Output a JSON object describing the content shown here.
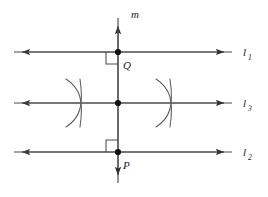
{
  "figure": {
    "type": "geometry-diagram",
    "width": 268,
    "height": 197,
    "background_color": "#ffffff",
    "stroke_color": "#3a3a3a",
    "label_color": "#1a1a1a"
  },
  "labels": {
    "line_m": "m",
    "line_1": "l",
    "line_1_sub": "1",
    "line_2": "l",
    "line_2_sub": "2",
    "line_3": "l",
    "line_3_sub": "3",
    "point_q": "Q",
    "point_p": "P"
  },
  "elements": {
    "vertical_line": {
      "name": "m",
      "x": 118,
      "y_top": 18,
      "y_bottom": 183,
      "arrow_top": true,
      "arrow_bottom": true
    },
    "horizontal_lines": [
      {
        "name": "l1",
        "y": 52,
        "x_left": 14,
        "x_right": 232,
        "arrow_left": true,
        "arrow_right": true
      },
      {
        "name": "l3",
        "y": 103,
        "x_left": 14,
        "x_right": 232,
        "arrow_left": true,
        "arrow_right": true
      },
      {
        "name": "l2",
        "y": 152,
        "x_left": 14,
        "x_right": 232,
        "arrow_left": true,
        "arrow_right": true
      }
    ],
    "points": [
      {
        "name": "Q",
        "x": 118,
        "y": 52,
        "label_x": 123,
        "label_y": 68
      },
      {
        "name": "center",
        "x": 118,
        "y": 103,
        "label_x": null,
        "label_y": null
      },
      {
        "name": "P",
        "x": 118,
        "y": 152,
        "label_x": 123,
        "label_y": 168
      }
    ],
    "right_angle_marks": [
      {
        "at_point": "Q",
        "corner": "lower-left",
        "x": 106,
        "y": 52,
        "size": 12
      },
      {
        "at_point": "P",
        "corner": "upper-left",
        "x": 106,
        "y": 140,
        "size": 12
      }
    ],
    "compass_arcs": [
      {
        "side": "left",
        "group": "upper",
        "center_x": 78,
        "center_y": 103
      },
      {
        "side": "left",
        "group": "lower",
        "center_x": 78,
        "center_y": 103
      },
      {
        "side": "right",
        "group": "upper",
        "center_x": 168,
        "center_y": 103
      },
      {
        "side": "right",
        "group": "lower",
        "center_x": 168,
        "center_y": 103
      }
    ]
  }
}
